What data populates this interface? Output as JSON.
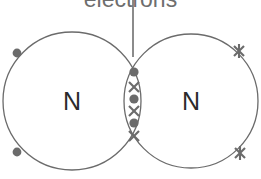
{
  "diagram": {
    "kind": "dot-and-cross-bonding-diagram",
    "annotation": {
      "text": "electrons",
      "color": "#6e6e6e",
      "clipped_at_top": true
    },
    "leader_line": {
      "color": "#4d4d4d",
      "from": {
        "x": 133,
        "y": 0
      },
      "to": {
        "x": 133,
        "y": 57
      }
    },
    "atoms": [
      {
        "id": "left-atom",
        "symbol": "N",
        "center": {
          "x": 72,
          "y": 101
        },
        "radius": 69,
        "outline_color": "#6b6b6b",
        "marker": "dot"
      },
      {
        "id": "right-atom",
        "symbol": "N",
        "center": {
          "x": 191,
          "y": 101
        },
        "radius": 67,
        "outline_color": "#6b6b6b",
        "marker": "cross"
      }
    ],
    "lone_pair_dots": [
      {
        "x": 17,
        "y": 53
      },
      {
        "x": 17,
        "y": 152
      }
    ],
    "lone_pair_crosses": [
      {
        "x": 239,
        "y": 51
      },
      {
        "x": 240,
        "y": 153
      }
    ],
    "shared_electrons": {
      "description": "alternating dots and crosses in the overlap region",
      "dot_color": "#6b6b6b",
      "cross_color": "#6b6b6b",
      "markers": [
        {
          "type": "dot",
          "x": 134,
          "y": 72
        },
        {
          "type": "cross",
          "x": 134,
          "y": 87
        },
        {
          "type": "dot",
          "x": 134,
          "y": 99
        },
        {
          "type": "cross",
          "x": 134,
          "y": 111
        },
        {
          "type": "dot",
          "x": 134,
          "y": 123
        },
        {
          "type": "cross",
          "x": 134,
          "y": 136
        }
      ]
    },
    "colors": {
      "background": "#ffffff",
      "outline": "#6b6b6b",
      "marker": "#6b6b6b",
      "label": "#6e6e6e",
      "atom_symbol": "#2b2b2b"
    }
  }
}
